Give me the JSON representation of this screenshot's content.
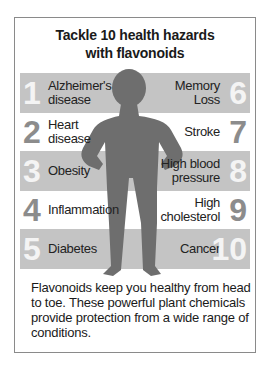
{
  "title_line1": "Tackle 10 health hazards",
  "title_line2": "with flavonoids",
  "left": [
    {
      "num": "1",
      "line1": "Alzheimer's",
      "line2": "disease"
    },
    {
      "num": "2",
      "line1": "Heart",
      "line2": "disease"
    },
    {
      "num": "3",
      "line1": "Obesity",
      "line2": ""
    },
    {
      "num": "4",
      "line1": "Inflammation",
      "line2": ""
    },
    {
      "num": "5",
      "line1": "Diabetes",
      "line2": ""
    }
  ],
  "right": [
    {
      "num": "6",
      "line1": "Memory",
      "line2": "Loss"
    },
    {
      "num": "7",
      "line1": "Stroke",
      "line2": ""
    },
    {
      "num": "8",
      "line1": "High blood",
      "line2": "pressure"
    },
    {
      "num": "9",
      "line1": "High",
      "line2": "cholesterol"
    },
    {
      "num": "10",
      "line1": "Cancer",
      "line2": ""
    }
  ],
  "description": "Flavonoids keep you healthy from head to toe. These powerful plant chemicals provide protection from a wide range of conditions.",
  "colors": {
    "band": "#c4c4c4",
    "figure": "#6e6e6e",
    "number_light": "#f4f4f4",
    "number_dark": "#8c8c8c"
  }
}
